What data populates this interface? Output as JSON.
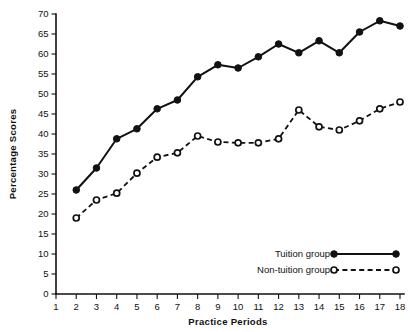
{
  "chart_data": {
    "type": "line",
    "title": "",
    "xlabel": "Practice Periods",
    "ylabel": "Percentage Scores",
    "xlim": [
      1,
      18
    ],
    "ylim": [
      0,
      70
    ],
    "grid": false,
    "legend_position": "bottom-right",
    "x": [
      2,
      3,
      4,
      5,
      6,
      7,
      8,
      9,
      10,
      11,
      12,
      13,
      14,
      15,
      16,
      17,
      18
    ],
    "xticks": [
      1,
      2,
      3,
      4,
      5,
      6,
      7,
      8,
      9,
      10,
      11,
      12,
      13,
      14,
      15,
      16,
      17,
      18
    ],
    "yticks": [
      0,
      5,
      10,
      15,
      20,
      25,
      30,
      35,
      40,
      45,
      50,
      55,
      60,
      65,
      70
    ],
    "series": [
      {
        "name": "Tuition group",
        "marker": "filled-circle",
        "line_style": "solid",
        "color": "#111111",
        "values": [
          26.0,
          31.5,
          38.8,
          41.3,
          46.3,
          48.5,
          54.3,
          57.3,
          56.5,
          59.3,
          62.5,
          60.3,
          63.3,
          60.3,
          65.5,
          68.3,
          67.0
        ]
      },
      {
        "name": "Non-tuition group",
        "marker": "open-circle",
        "line_style": "dashed",
        "color": "#111111",
        "values": [
          19.0,
          23.5,
          25.2,
          30.2,
          34.2,
          35.3,
          39.5,
          38.0,
          37.8,
          37.8,
          38.8,
          46.0,
          41.8,
          41.0,
          43.3,
          46.3,
          48.0
        ]
      }
    ]
  },
  "legend": {
    "entries": [
      {
        "label": "Tuition group",
        "marker": "filled-circle",
        "line_style": "solid"
      },
      {
        "label": "Non-tuition group",
        "marker": "open-circle",
        "line_style": "dashed"
      }
    ]
  },
  "axes": {
    "x_title": "Practice Periods",
    "y_title": "Percentage Scores"
  }
}
